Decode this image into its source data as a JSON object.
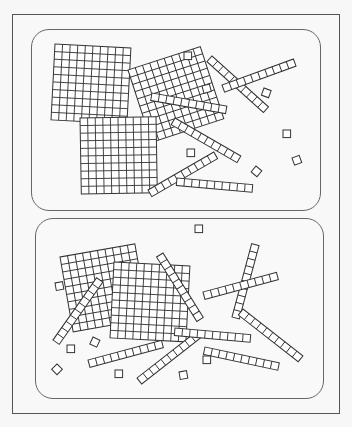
{
  "figure": {
    "stroke_color": "#333333",
    "fill_color": "#ffffff",
    "panels": [
      {
        "id": "A",
        "hundreds": 3,
        "tens": 6,
        "ones": 7,
        "flats": [
          {
            "x": 55,
            "y": 44,
            "rot": 3
          },
          {
            "x": 128,
            "y": 70,
            "rot": -18
          },
          {
            "x": 80,
            "y": 118,
            "rot": -1
          }
        ],
        "rods": [
          {
            "x": 152,
            "y": 93,
            "rot": 10
          },
          {
            "x": 175,
            "y": 118,
            "rot": 30
          },
          {
            "x": 148,
            "y": 190,
            "rot": -30
          },
          {
            "x": 177,
            "y": 178,
            "rot": 5
          },
          {
            "x": 212,
            "y": 56,
            "rot": 42
          },
          {
            "x": 222,
            "y": 85,
            "rot": -20
          }
        ],
        "units": [
          {
            "x": 184,
            "y": 52,
            "rot": 0
          },
          {
            "x": 202,
            "y": 86,
            "rot": -15
          },
          {
            "x": 264,
            "y": 88,
            "rot": 20
          },
          {
            "x": 283,
            "y": 130,
            "rot": 0
          },
          {
            "x": 187,
            "y": 149,
            "rot": 0
          },
          {
            "x": 256,
            "y": 166,
            "rot": 40
          },
          {
            "x": 292,
            "y": 158,
            "rot": -20
          }
        ]
      },
      {
        "id": "B",
        "hundreds": 2,
        "tens": 9,
        "ones": 8,
        "flats": [
          {
            "x": 60,
            "y": 257,
            "rot": -10
          },
          {
            "x": 114,
            "y": 262,
            "rot": 3
          }
        ],
        "rods": [
          {
            "x": 53,
            "y": 340,
            "rot": -55
          },
          {
            "x": 88,
            "y": 360,
            "rot": -15
          },
          {
            "x": 137,
            "y": 378,
            "rot": -38
          },
          {
            "x": 163,
            "y": 253,
            "rot": 58
          },
          {
            "x": 175,
            "y": 328,
            "rot": 5
          },
          {
            "x": 205,
            "y": 347,
            "rot": 12
          },
          {
            "x": 232,
            "y": 317,
            "rot": -75
          },
          {
            "x": 203,
            "y": 292,
            "rot": -15
          },
          {
            "x": 243,
            "y": 309,
            "rot": 38
          }
        ],
        "units": [
          {
            "x": 55,
            "y": 283,
            "rot": -10
          },
          {
            "x": 67,
            "y": 345,
            "rot": 0
          },
          {
            "x": 93,
            "y": 337,
            "rot": 25
          },
          {
            "x": 57,
            "y": 364,
            "rot": 45
          },
          {
            "x": 115,
            "y": 370,
            "rot": 0
          },
          {
            "x": 195,
            "y": 225,
            "rot": 0
          },
          {
            "x": 203,
            "y": 356,
            "rot": 0
          },
          {
            "x": 179,
            "y": 372,
            "rot": -10
          }
        ]
      }
    ]
  }
}
